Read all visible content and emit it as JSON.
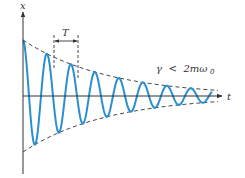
{
  "diagram": {
    "axes": {
      "y_label": "x",
      "x_label": "t"
    },
    "period_label": "T",
    "condition_label": {
      "gamma": "γ",
      "relation": "<",
      "rhs": "2mω",
      "subscript": "0"
    },
    "colors": {
      "curve": "#2a8fcf",
      "axis": "#333333",
      "envelope": "#333333",
      "background": "#ffffff"
    },
    "geometry": {
      "origin_x": 23,
      "axis_y": 96,
      "y_axis_top": 12,
      "y_axis_bottom": 174,
      "x_axis_end": 222,
      "amplitude": 56,
      "decay": 0.0118,
      "period_px": 24,
      "curve_end_x": 212,
      "t_bracket": {
        "x1": 54,
        "x2": 78,
        "y": 41
      }
    }
  }
}
